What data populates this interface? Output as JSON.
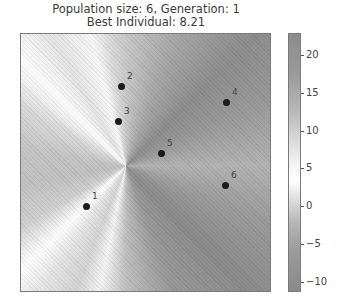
{
  "title": {
    "line1": "Population size: 6, Generation: 1",
    "line2": "Best Individual: 8.21"
  },
  "chart_data": {
    "type": "heatmap",
    "xlabel": "",
    "ylabel": "",
    "grid": false,
    "colormap": "grayscale diverging (dark at extremes, white near ~5)",
    "colorbar": {
      "range": [
        -11.3,
        22.9
      ],
      "ticks": [
        20,
        15,
        10,
        5,
        0,
        -5,
        -10
      ],
      "tick_labels": [
        "20",
        "15",
        "10",
        "5",
        "0",
        "−5",
        "−10"
      ]
    },
    "series": [
      {
        "name": "population",
        "type": "scatter",
        "points": [
          {
            "label": "1",
            "px": 86,
            "py": 206
          },
          {
            "label": "2",
            "px": 121,
            "py": 86
          },
          {
            "label": "3",
            "px": 118,
            "py": 121
          },
          {
            "label": "4",
            "px": 226,
            "py": 102
          },
          {
            "label": "5",
            "px": 161,
            "py": 153
          },
          {
            "label": "6",
            "px": 225,
            "py": 185
          }
        ]
      }
    ],
    "population_size": 6,
    "generation": 1,
    "best_individual": 8.21
  },
  "colorbar_ticks": [
    {
      "label": "20",
      "y": 55
    },
    {
      "label": "15",
      "y": 93
    },
    {
      "label": "10",
      "y": 131
    },
    {
      "label": "5",
      "y": 168
    },
    {
      "label": "0",
      "y": 206
    },
    {
      "label": "−5",
      "y": 244
    },
    {
      "label": "−10",
      "y": 282
    }
  ]
}
